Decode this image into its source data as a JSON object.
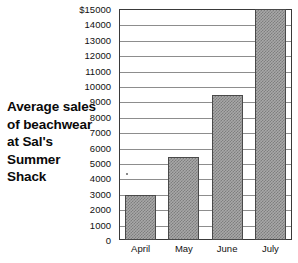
{
  "title": {
    "lines": [
      "Average sales",
      "of beachwear",
      "at Sal's",
      "Summer",
      "Shack"
    ],
    "full_text": "Average sales of beachwear at Sal's Summer Shack"
  },
  "chart_data": {
    "type": "bar",
    "xlabel": "",
    "ylabel": "",
    "categories": [
      "April",
      "May",
      "June",
      "July"
    ],
    "values": [
      2950,
      5400,
      9400,
      15000
    ],
    "ylim": [
      0,
      15000
    ],
    "ytick_step": 1000,
    "ytick_labels": [
      "0",
      "1000",
      "2000",
      "3000",
      "4000",
      "5000",
      "6000",
      "7000",
      "8000",
      "9000",
      "10000",
      "11000",
      "12000",
      "13000",
      "14000",
      "$15000"
    ],
    "ytick_values": [
      0,
      1000,
      2000,
      3000,
      4000,
      5000,
      6000,
      7000,
      8000,
      9000,
      10000,
      11000,
      12000,
      13000,
      14000,
      15000
    ],
    "currency_symbol": "$",
    "grid": true,
    "legend": false,
    "legend_position": "none",
    "bar_fill": "checkered-gray",
    "colors": {
      "bar_fill": "#a8a8a8",
      "bar_pattern": "#7e7e7e",
      "bar_border": "#4a4a4a",
      "gridline": "#8d8d8d",
      "frame": "#3a3a3a",
      "text": "#111111",
      "background": "#ffffff"
    }
  }
}
